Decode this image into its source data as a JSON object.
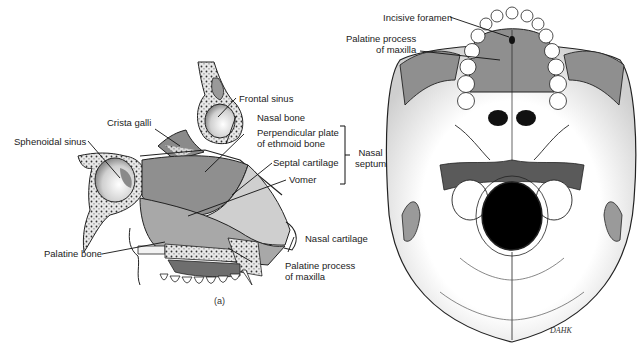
{
  "figure": {
    "caption": "(a)",
    "signature": "DAHK"
  },
  "sagittal_view": {
    "labels": [
      {
        "id": "frontal_sinus",
        "text": "Frontal sinus"
      },
      {
        "id": "crista_galli",
        "text": "Crista galli"
      },
      {
        "id": "nasal_bone",
        "text": "Nasal bone"
      },
      {
        "id": "sphenoidal_sinus",
        "text": "Sphenoidal sinus"
      },
      {
        "id": "perpendicular_plate",
        "line1": "Perpendicular plate",
        "line2": "of ethmoid bone"
      },
      {
        "id": "septal_cartilage",
        "text": "Septal cartilage"
      },
      {
        "id": "vomer",
        "text": "Vomer"
      },
      {
        "id": "nasal_cartilage",
        "text": "Nasal cartilage"
      },
      {
        "id": "palatine_bone",
        "text": "Palatine bone"
      },
      {
        "id": "palatine_process",
        "line1": "Palatine process",
        "line2": "of maxilla"
      }
    ],
    "bracket_group": {
      "line1": "Nasal",
      "line2": "septum"
    }
  },
  "inferior_view": {
    "labels": [
      {
        "id": "incisive_foramen",
        "text": "Incisive foramen"
      },
      {
        "id": "palatine_process",
        "line1": "Palatine process",
        "line2": "of maxilla"
      }
    ]
  },
  "colors": {
    "bone_gray": "#8f8f8f",
    "light_gray": "#b9b9b9",
    "cartilage_gray": "#cfcfcf",
    "dark": "#111111",
    "outline": "#222222"
  }
}
